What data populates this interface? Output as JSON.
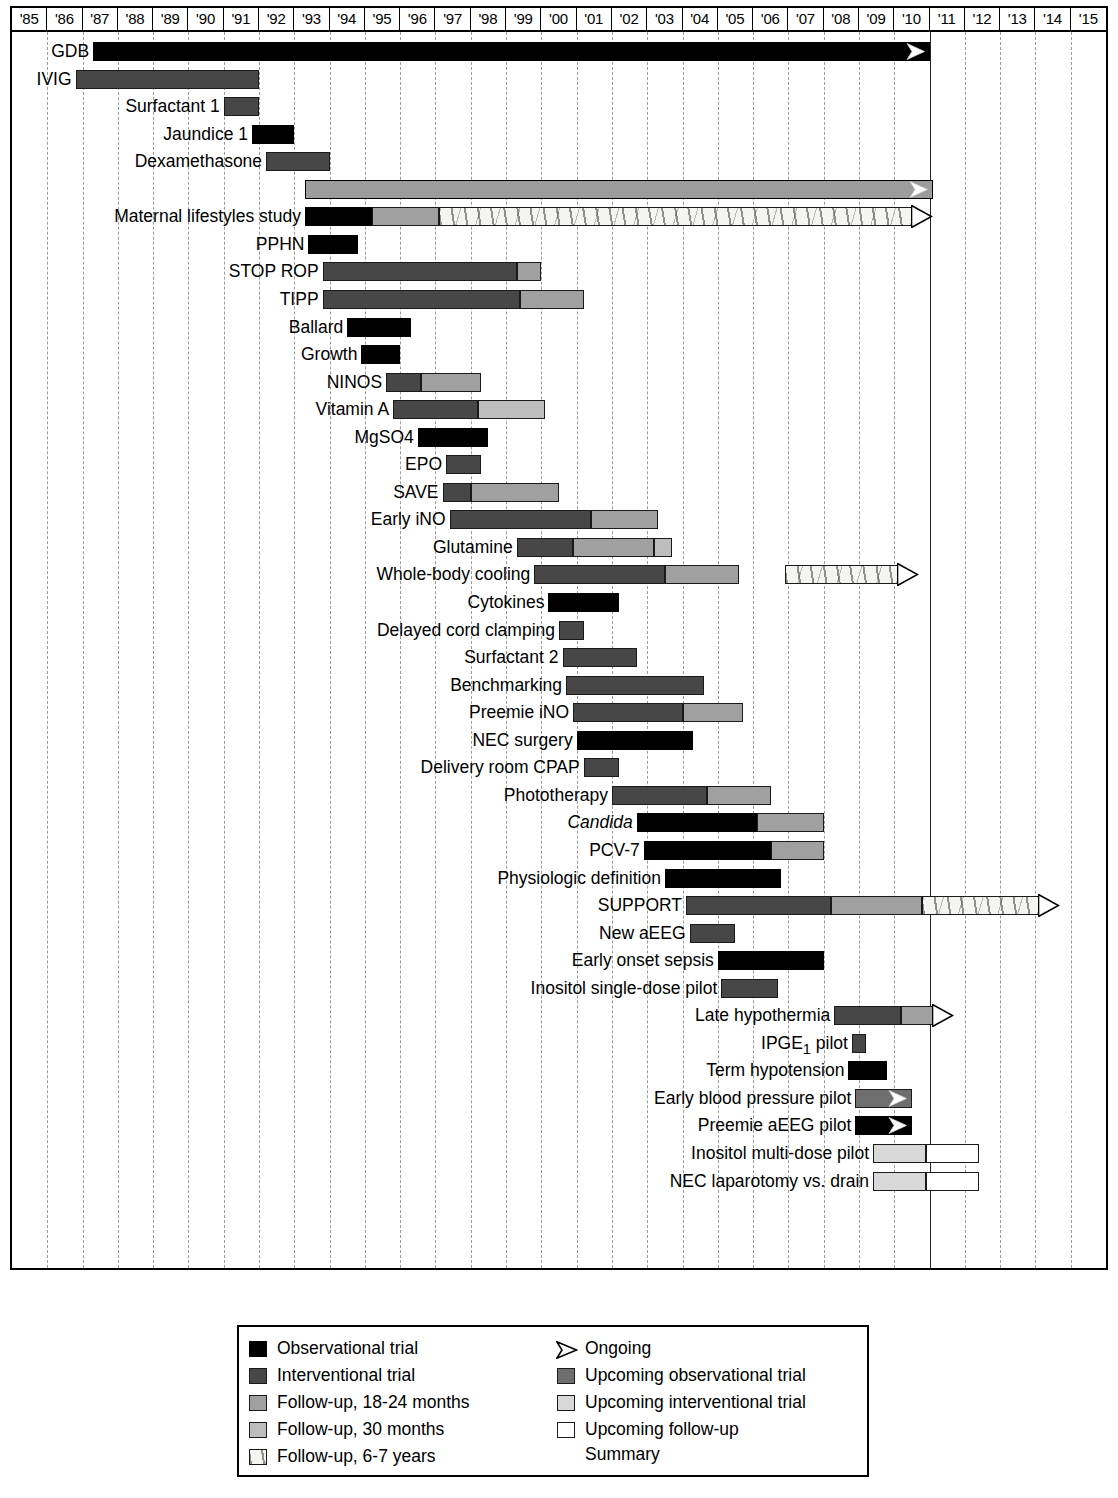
{
  "axis": {
    "years": [
      "'85",
      "'86",
      "'87",
      "'88",
      "'89",
      "'90",
      "'91",
      "'92",
      "'93",
      "'94",
      "'95",
      "'96",
      "'97",
      "'98",
      "'99",
      "'00",
      "'01",
      "'02",
      "'03",
      "'04",
      "'05",
      "'06",
      "'07",
      "'08",
      "'09",
      "'10",
      "'11",
      "'12",
      "'13",
      "'14",
      "'15"
    ],
    "start_year": 1985,
    "end_year": 2016,
    "present_line_year": 2011
  },
  "legend": {
    "left": [
      {
        "label": "Observational trial",
        "key": "obs"
      },
      {
        "label": "Interventional trial",
        "key": "int"
      },
      {
        "label": "Follow-up, 18-24 months",
        "key": "fu18"
      },
      {
        "label": "Follow-up, 30 months",
        "key": "fu30"
      },
      {
        "label": "Follow-up, 6-7 years",
        "key": "fu67"
      }
    ],
    "right": [
      {
        "label": "Ongoing",
        "key": "ongoing"
      },
      {
        "label": "Upcoming observational trial",
        "key": "upobs"
      },
      {
        "label": "Upcoming interventional trial",
        "key": "upint"
      },
      {
        "label": "Upcoming follow-up",
        "key": "upfu"
      }
    ],
    "right_extra_line": "Summary"
  },
  "colors": {
    "observational": "#000000",
    "interventional": "#474747",
    "followup_18_24": "#a0a0a0",
    "followup_30": "#bdbdbd",
    "followup_6_7": "#f4f4f0",
    "upcoming_observational": "#6e6e6e",
    "upcoming_interventional": "#d8d8d8",
    "upcoming_followup": "#ffffff",
    "summary_bar": "#9c9c9c",
    "gridline": "#9a9a9a",
    "present_line": "#222222"
  },
  "chart_data": {
    "type": "bar",
    "subtype": "gantt",
    "title": "",
    "xlabel": "",
    "ylabel": "",
    "xlim": [
      1985,
      2016
    ],
    "grid": true,
    "legend_position": "bottom",
    "categories": [
      "GDB",
      "IVIG",
      "Surfactant 1",
      "Jaundice 1",
      "Dexamethasone",
      "Summary",
      "Maternal lifestyles study",
      "PPHN",
      "STOP ROP",
      "TIPP",
      "Ballard",
      "Growth",
      "NINOS",
      "Vitamin A",
      "MgSO4",
      "EPO",
      "SAVE",
      "Early iNO",
      "Glutamine",
      "Whole-body cooling",
      "Cytokines",
      "Delayed cord clamping",
      "Surfactant 2",
      "Benchmarking",
      "Preemie iNO",
      "NEC surgery",
      "Delivery room CPAP",
      "Phototherapy",
      "Candida",
      "PCV-7",
      "Physiologic definition",
      "SUPPORT",
      "New aEEG",
      "Early onset sepsis",
      "Inositol single-dose pilot",
      "Late hypothermia",
      "IPGE1 pilot",
      "Term hypotension",
      "Early blood pressure pilot",
      "Preemie aEEG pilot",
      "Inositol multi-dose pilot",
      "NEC laparotomy vs. drain"
    ],
    "rows": [
      {
        "label": "GDB",
        "italic": false,
        "label_html": "GDB",
        "segments": [
          {
            "type": "obs",
            "start": 1987.3,
            "end": 2011.0
          }
        ],
        "ongoing": true,
        "arrow": "inside"
      },
      {
        "label": "IVIG",
        "italic": false,
        "label_html": "IVIG",
        "segments": [
          {
            "type": "int",
            "start": 1986.8,
            "end": 1992.0
          }
        ],
        "ongoing": false
      },
      {
        "label": "Surfactant 1",
        "italic": false,
        "label_html": "Surfactant 1",
        "segments": [
          {
            "type": "int",
            "start": 1991.0,
            "end": 1992.0
          }
        ],
        "ongoing": false
      },
      {
        "label": "Jaundice 1",
        "italic": false,
        "label_html": "Jaundice 1",
        "segments": [
          {
            "type": "obs",
            "start": 1991.8,
            "end": 1993.0
          }
        ],
        "ongoing": false
      },
      {
        "label": "Dexamethasone",
        "italic": false,
        "label_html": "Dexamethasone",
        "segments": [
          {
            "type": "int",
            "start": 1992.2,
            "end": 1994.0
          }
        ],
        "ongoing": false
      },
      {
        "label": "",
        "italic": false,
        "label_html": "",
        "segments": [
          {
            "type": "sum",
            "start": 1993.3,
            "end": 2011.1
          }
        ],
        "ongoing": true,
        "arrow": "inside"
      },
      {
        "label": "Maternal lifestyles study",
        "italic": false,
        "label_html": "Maternal lifestyles study",
        "segments": [
          {
            "type": "obs",
            "start": 1993.3,
            "end": 1995.2
          },
          {
            "type": "fu18",
            "start": 1995.2,
            "end": 1997.1
          },
          {
            "type": "fu67",
            "start": 1997.1,
            "end": 2010.5
          }
        ],
        "ongoing": true,
        "arrow": "outside"
      },
      {
        "label": "PPHN",
        "italic": false,
        "label_html": "PPHN",
        "segments": [
          {
            "type": "obs",
            "start": 1993.4,
            "end": 1994.8
          }
        ],
        "ongoing": false
      },
      {
        "label": "STOP ROP",
        "italic": false,
        "label_html": "STOP ROP",
        "segments": [
          {
            "type": "int",
            "start": 1993.8,
            "end": 1999.3
          },
          {
            "type": "fu18",
            "start": 1999.3,
            "end": 2000.0
          }
        ],
        "ongoing": false
      },
      {
        "label": "TIPP",
        "italic": false,
        "label_html": "TIPP",
        "segments": [
          {
            "type": "int",
            "start": 1993.8,
            "end": 1999.4
          },
          {
            "type": "fu18",
            "start": 1999.4,
            "end": 2001.2
          }
        ],
        "ongoing": false
      },
      {
        "label": "Ballard",
        "italic": false,
        "label_html": "Ballard",
        "segments": [
          {
            "type": "obs",
            "start": 1994.5,
            "end": 1996.3
          }
        ],
        "ongoing": false
      },
      {
        "label": "Growth",
        "italic": false,
        "label_html": "Growth",
        "segments": [
          {
            "type": "obs",
            "start": 1994.9,
            "end": 1996.0
          }
        ],
        "ongoing": false
      },
      {
        "label": "NINOS",
        "italic": false,
        "label_html": "NINOS",
        "segments": [
          {
            "type": "int",
            "start": 1995.6,
            "end": 1996.6
          },
          {
            "type": "fu18",
            "start": 1996.6,
            "end": 1998.3
          }
        ],
        "ongoing": false
      },
      {
        "label": "Vitamin A",
        "italic": false,
        "label_html": "Vitamin A",
        "segments": [
          {
            "type": "int",
            "start": 1995.8,
            "end": 1998.2
          },
          {
            "type": "fu30",
            "start": 1998.2,
            "end": 2000.1
          }
        ],
        "ongoing": false
      },
      {
        "label": "MgSO4",
        "italic": false,
        "label_html": "MgSO4",
        "segments": [
          {
            "type": "obs",
            "start": 1996.5,
            "end": 1998.5
          }
        ],
        "ongoing": false
      },
      {
        "label": "EPO",
        "italic": false,
        "label_html": "EPO",
        "segments": [
          {
            "type": "int",
            "start": 1997.3,
            "end": 1998.3
          }
        ],
        "ongoing": false
      },
      {
        "label": "SAVE",
        "italic": false,
        "label_html": "SAVE",
        "segments": [
          {
            "type": "int",
            "start": 1997.2,
            "end": 1998.0
          },
          {
            "type": "fu18",
            "start": 1998.0,
            "end": 2000.5
          }
        ],
        "ongoing": false
      },
      {
        "label": "Early iNO",
        "italic": false,
        "label_html": "Early iNO",
        "segments": [
          {
            "type": "int",
            "start": 1997.4,
            "end": 2001.4
          },
          {
            "type": "fu18",
            "start": 2001.4,
            "end": 2003.3
          }
        ],
        "ongoing": false
      },
      {
        "label": "Glutamine",
        "italic": false,
        "label_html": "Glutamine",
        "segments": [
          {
            "type": "int",
            "start": 1999.3,
            "end": 2000.9
          },
          {
            "type": "fu18",
            "start": 2000.9,
            "end": 2003.2
          },
          {
            "type": "fu30",
            "start": 2003.2,
            "end": 2003.7
          }
        ],
        "ongoing": false
      },
      {
        "label": "Whole-body cooling",
        "italic": false,
        "label_html": "Whole-body cooling",
        "segments": [
          {
            "type": "int",
            "start": 1999.8,
            "end": 2003.5
          },
          {
            "type": "fu18",
            "start": 2003.5,
            "end": 2005.6
          },
          {
            "type": "fu67",
            "start": 2006.9,
            "end": 2010.1,
            "gap": true
          }
        ],
        "ongoing": true,
        "arrow": "outside"
      },
      {
        "label": "Cytokines",
        "italic": false,
        "label_html": "Cytokines",
        "segments": [
          {
            "type": "obs",
            "start": 2000.2,
            "end": 2002.2
          }
        ],
        "ongoing": false
      },
      {
        "label": "Delayed cord clamping",
        "italic": false,
        "label_html": "Delayed cord clamping",
        "segments": [
          {
            "type": "int",
            "start": 2000.5,
            "end": 2001.2
          }
        ],
        "ongoing": false
      },
      {
        "label": "Surfactant 2",
        "italic": false,
        "label_html": "Surfactant 2",
        "segments": [
          {
            "type": "int",
            "start": 2000.6,
            "end": 2002.7
          }
        ],
        "ongoing": false
      },
      {
        "label": "Benchmarking",
        "italic": false,
        "label_html": "Benchmarking",
        "segments": [
          {
            "type": "int",
            "start": 2000.7,
            "end": 2004.6
          }
        ],
        "ongoing": false
      },
      {
        "label": "Preemie iNO",
        "italic": false,
        "label_html": "Preemie iNO",
        "segments": [
          {
            "type": "int",
            "start": 2000.9,
            "end": 2004.0
          },
          {
            "type": "fu18",
            "start": 2004.0,
            "end": 2005.7
          }
        ],
        "ongoing": false
      },
      {
        "label": "NEC surgery",
        "italic": false,
        "label_html": "NEC surgery",
        "segments": [
          {
            "type": "obs",
            "start": 2001.0,
            "end": 2004.3
          }
        ],
        "ongoing": false
      },
      {
        "label": "Delivery room CPAP",
        "italic": false,
        "label_html": "Delivery room CPAP",
        "segments": [
          {
            "type": "int",
            "start": 2001.2,
            "end": 2002.2
          }
        ],
        "ongoing": false
      },
      {
        "label": "Phototherapy",
        "italic": false,
        "label_html": "Phototherapy",
        "segments": [
          {
            "type": "int",
            "start": 2002.0,
            "end": 2004.7
          },
          {
            "type": "fu18",
            "start": 2004.7,
            "end": 2006.5
          }
        ],
        "ongoing": false
      },
      {
        "label": "Candida",
        "italic": true,
        "label_html": "Candida",
        "segments": [
          {
            "type": "obs",
            "start": 2002.7,
            "end": 2006.1
          },
          {
            "type": "fu18",
            "start": 2006.1,
            "end": 2008.0
          }
        ],
        "ongoing": false
      },
      {
        "label": "PCV-7",
        "italic": false,
        "label_html": "PCV-7",
        "segments": [
          {
            "type": "obs",
            "start": 2002.9,
            "end": 2006.5
          },
          {
            "type": "fu18",
            "start": 2006.5,
            "end": 2008.0
          }
        ],
        "ongoing": false
      },
      {
        "label": "Physiologic definition",
        "italic": false,
        "label_html": "Physiologic definition",
        "segments": [
          {
            "type": "obs",
            "start": 2003.5,
            "end": 2006.8
          }
        ],
        "ongoing": false
      },
      {
        "label": "SUPPORT",
        "italic": false,
        "label_html": "SUPPORT",
        "segments": [
          {
            "type": "int",
            "start": 2004.1,
            "end": 2008.2
          },
          {
            "type": "fu18",
            "start": 2008.2,
            "end": 2010.8
          },
          {
            "type": "fu67",
            "start": 2010.8,
            "end": 2014.1
          }
        ],
        "ongoing": true,
        "arrow": "outside"
      },
      {
        "label": "New aEEG",
        "italic": false,
        "label_html": "New aEEG",
        "segments": [
          {
            "type": "int",
            "start": 2004.2,
            "end": 2005.5
          }
        ],
        "ongoing": false
      },
      {
        "label": "Early onset sepsis",
        "italic": false,
        "label_html": "Early onset sepsis",
        "segments": [
          {
            "type": "obs",
            "start": 2005.0,
            "end": 2008.0
          }
        ],
        "ongoing": false
      },
      {
        "label": "Inositol single-dose pilot",
        "italic": false,
        "label_html": "Inositol single-dose pilot",
        "segments": [
          {
            "type": "int",
            "start": 2005.1,
            "end": 2006.7
          }
        ],
        "ongoing": false
      },
      {
        "label": "Late hypothermia",
        "italic": false,
        "label_html": "Late hypothermia",
        "segments": [
          {
            "type": "int",
            "start": 2008.3,
            "end": 2010.2
          },
          {
            "type": "fu18",
            "start": 2010.2,
            "end": 2011.1
          }
        ],
        "ongoing": true,
        "arrow": "outside"
      },
      {
        "label": "IPGE1 pilot",
        "italic": false,
        "label_html": "IPGE<sub>1</sub> pilot",
        "segments": [
          {
            "type": "int",
            "start": 2008.8,
            "end": 2009.2
          }
        ],
        "ongoing": false
      },
      {
        "label": "Term hypotension",
        "italic": false,
        "label_html": "Term hypotension",
        "segments": [
          {
            "type": "obs",
            "start": 2008.7,
            "end": 2009.8
          }
        ],
        "ongoing": false
      },
      {
        "label": "Early blood pressure pilot",
        "italic": false,
        "label_html": "Early blood pressure pilot",
        "segments": [
          {
            "type": "upobs",
            "start": 2008.9,
            "end": 2010.5
          }
        ],
        "ongoing": true,
        "arrow": "inside"
      },
      {
        "label": "Preemie aEEG pilot",
        "italic": false,
        "label_html": "Preemie aEEG pilot",
        "segments": [
          {
            "type": "obs",
            "start": 2008.9,
            "end": 2010.5
          }
        ],
        "ongoing": true,
        "arrow": "inside"
      },
      {
        "label": "Inositol multi-dose pilot",
        "italic": false,
        "label_html": "Inositol multi-dose pilot",
        "segments": [
          {
            "type": "upint",
            "start": 2009.4,
            "end": 2010.9
          },
          {
            "type": "upfu",
            "start": 2010.9,
            "end": 2012.4
          }
        ],
        "ongoing": false
      },
      {
        "label": "NEC laparotomy vs. drain",
        "italic": false,
        "label_html": "NEC laparotomy vs. drain",
        "segments": [
          {
            "type": "upint",
            "start": 2009.4,
            "end": 2010.9
          },
          {
            "type": "upfu",
            "start": 2010.9,
            "end": 2012.4
          }
        ],
        "ongoing": false
      }
    ]
  }
}
